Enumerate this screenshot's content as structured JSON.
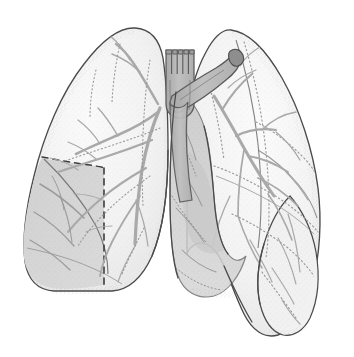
{
  "figure": {
    "title": "Human Lungs - Anterior View",
    "subject": "lungs",
    "view": "anterior",
    "style": "grayscale pen-and-ink anatomical illustration with stipple shading",
    "canvas": {
      "width": 354,
      "height": 357,
      "background": "#ffffff"
    }
  },
  "palette": {
    "background": "#ffffff",
    "outline": "#4a4a4a",
    "outline_soft": "#6e6e6e",
    "lung_fill_light": "#f4f4f4",
    "lung_fill_mid": "#ededed",
    "lobe_shaded": "#d8d8d8",
    "mediastinum_shadow": "#cfcfcf",
    "heart_shadow": "#c4c4c4",
    "airway_fill": "#b9b9b9",
    "airway_outline": "#5a5a5a",
    "vessel": "#a9a9a9",
    "vessel_dotted": "#9a9a9a",
    "dashed_fissure": "#3d3d3d",
    "stipple": "#8c8c8c"
  },
  "structures": [
    {
      "id": "right-lung",
      "label": "Right lung (viewer left)",
      "side": "right",
      "fill": "#f4f4f4",
      "outline": "#4a4a4a",
      "apex": {
        "x": 135,
        "y": 28
      },
      "base_y": 292,
      "lateral_x": 24
    },
    {
      "id": "left-lung",
      "label": "Left lung (viewer right)",
      "side": "left",
      "fill": "#f4f4f4",
      "outline": "#4a4a4a",
      "apex": {
        "x": 231,
        "y": 30
      },
      "base_y": 336,
      "lateral_x": 320
    },
    {
      "id": "right-upper-lobe",
      "label": "Right upper lobe",
      "fill": "#f4f4f4"
    },
    {
      "id": "right-middle-lobe",
      "label": "Right middle lobe",
      "fill": "#ededed"
    },
    {
      "id": "right-lower-lobe-shaded",
      "label": "Right lower lobe (shaded / highlighted segment)",
      "fill": "#d8d8d8",
      "note": "darker shaded region in the lower lateral quadrant of the viewer-left lung"
    },
    {
      "id": "left-upper-lobe",
      "label": "Left upper lobe",
      "fill": "#f4f4f4"
    },
    {
      "id": "left-lower-lobe",
      "label": "Left lower lobe",
      "fill": "#efefef"
    },
    {
      "id": "lingula-flap",
      "label": "Lingular / inferior lobe flap",
      "fill": "#f0f0f0"
    },
    {
      "id": "trachea",
      "label": "Trachea with cartilage rings",
      "fill": "#b9b9b9",
      "outline": "#5a5a5a",
      "ring_count": 5,
      "top_y": 48,
      "x_center": 178
    },
    {
      "id": "right-main-bronchus",
      "label": "Right main bronchus",
      "fill": "#b9b9b9"
    },
    {
      "id": "left-main-bronchus",
      "label": "Left main bronchus",
      "fill": "#b9b9b9"
    },
    {
      "id": "mediastinum",
      "label": "Mediastinal / cardiac shadow",
      "fill": "#cfcfcf"
    },
    {
      "id": "cardiac-notch",
      "label": "Cardiac notch",
      "fill": "#c4c4c4"
    },
    {
      "id": "oblique-fissure-dashed",
      "label": "Oblique fissure (dashed demarcation)",
      "stroke": "#3d3d3d",
      "style": "dashed",
      "dash_pattern": "6 5"
    },
    {
      "id": "horizontal-fissure-dotted",
      "label": "Horizontal fissure (dotted)",
      "stroke": "#9a9a9a",
      "style": "dotted"
    },
    {
      "id": "bronchial-tree",
      "label": "Bronchial and vascular tree",
      "stroke": "#a9a9a9"
    }
  ],
  "annotations": {
    "has_text_labels": false,
    "has_leader_lines": false,
    "has_scale_bar": false,
    "note": "No textual labels, numbers, or legend are printed in the image."
  }
}
